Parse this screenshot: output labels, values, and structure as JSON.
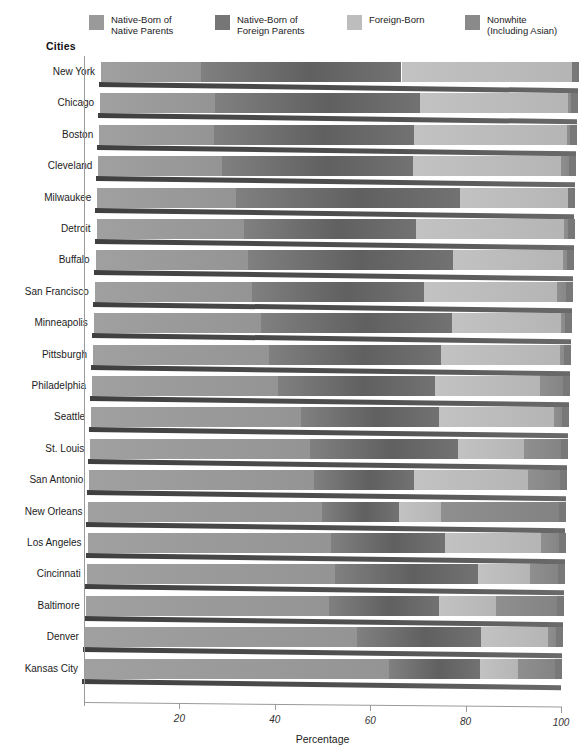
{
  "legend": {
    "items": [
      {
        "label": "Native-Born of\nNative Parents",
        "color": "#9a9a9a",
        "name": "native-born-native-parents"
      },
      {
        "label": "Native-Born of\nForeign Parents",
        "color": "#767676",
        "name": "native-born-foreign-parents"
      },
      {
        "label": "Foreign-Born",
        "color": "#bdbdbd",
        "name": "foreign-born"
      },
      {
        "label": "Nonwhite\n(Including Asian)",
        "color": "#8a8a8a",
        "name": "nonwhite-including-asian"
      }
    ]
  },
  "axes": {
    "category_axis_title": "Cities",
    "value_axis_title": "Percentage",
    "value_ticks": [
      "20",
      "40",
      "60",
      "80",
      "100"
    ],
    "value_tick_values": [
      20,
      40,
      60,
      80,
      100
    ],
    "xlim": [
      0,
      100
    ]
  },
  "chart_data": {
    "type": "bar",
    "orientation": "horizontal",
    "stacked": true,
    "percent_stacked": true,
    "title": "",
    "xlabel": "Percentage",
    "ylabel": "Cities",
    "xlim": [
      0,
      100
    ],
    "grid": false,
    "legend_position": "top",
    "categories": [
      "New York",
      "Chicago",
      "Boston",
      "Cleveland",
      "Milwaukee",
      "Detroit",
      "Buffalo",
      "San Francisco",
      "Minneapolis",
      "Pittsburgh",
      "Philadelphia",
      "Seattle",
      "St. Louis",
      "San Antonio",
      "New Orleans",
      "Los Angeles",
      "Cincinnati",
      "Baltimore",
      "Denver",
      "Kansas City"
    ],
    "series": [
      {
        "name": "Native-Born of Native Parents",
        "color": "#9a9a9a",
        "values": [
          21,
          24,
          24,
          26,
          29,
          31,
          32,
          33,
          35,
          37,
          39,
          44,
          46,
          47,
          49,
          51,
          52,
          51,
          57,
          64
        ]
      },
      {
        "name": "Native-Born of Foreign Parents",
        "color": "#767676",
        "values": [
          42,
          43,
          42,
          40,
          47,
          36,
          43,
          36,
          40,
          36,
          33,
          29,
          31,
          21,
          16,
          24,
          30,
          23,
          26,
          19
        ]
      },
      {
        "name": "Foreign-Born",
        "color": "#bdbdbd",
        "values": [
          36,
          31,
          32,
          31,
          23,
          31,
          23,
          28,
          23,
          25,
          22,
          24,
          14,
          24,
          9,
          20,
          11,
          12,
          14,
          8
        ]
      },
      {
        "name": "Nonwhite (Including Asian)",
        "color": "#8a8a8a",
        "values": [
          1,
          2,
          2,
          3,
          1,
          2,
          2,
          3,
          2,
          2,
          6,
          3,
          9,
          8,
          26,
          5,
          7,
          14,
          3,
          9
        ]
      }
    ]
  }
}
